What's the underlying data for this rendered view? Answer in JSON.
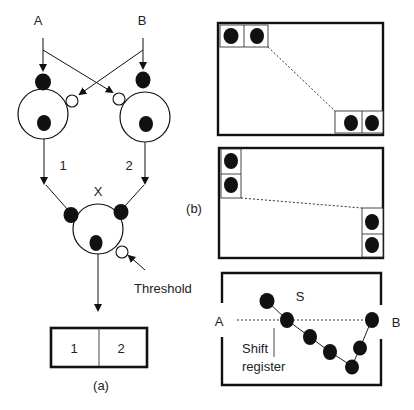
{
  "panel_a": {
    "caption": "(a)",
    "inputs": {
      "left": "A",
      "right": "B"
    },
    "neuron_labels": {
      "left_out": "1",
      "right_out": "2",
      "output": "X"
    },
    "threshold_label": "Threshold",
    "register_cells": [
      "1",
      "2"
    ]
  },
  "panel_b": {
    "caption": "(b)",
    "chain_box": {
      "label_s": "S",
      "label_left": "A",
      "label_right": "B",
      "shift_register_line1": "Shift",
      "shift_register_line2": "register"
    }
  },
  "colors": {
    "stroke": "#1a1a1a",
    "fill_dot": "#111111",
    "background": "#ffffff"
  }
}
